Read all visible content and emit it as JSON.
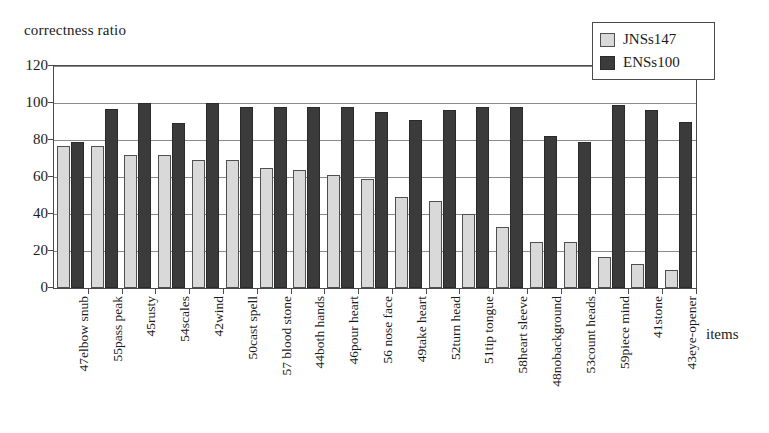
{
  "chart_data": {
    "type": "bar",
    "title": "",
    "ylabel": "correctness ratio",
    "xlabel": "items",
    "ylim": [
      0,
      120
    ],
    "yticks": [
      0,
      20,
      40,
      60,
      80,
      100,
      120
    ],
    "grid": true,
    "legend_position": "top-right",
    "categories": [
      "47elbow snub",
      "55pass peak",
      "45rusty",
      "54scales",
      "42wind",
      "50cast spell",
      "57 blood stone",
      "44both hands",
      "46pour heart",
      "56 nose face",
      "49take heart",
      "52turn head",
      "51tip tongue",
      "58heart sleeve",
      "48nobackground",
      "53count heads",
      "59piece mind",
      "41stone",
      "43eye-opener"
    ],
    "series": [
      {
        "name": "JNSs147",
        "color": "#d9d9d9",
        "values": [
          77,
          77,
          72,
          72,
          69,
          69,
          65,
          64,
          61,
          59,
          49,
          47,
          40,
          33,
          25,
          25,
          17,
          13,
          10
        ]
      },
      {
        "name": "ENSs100",
        "color": "#3b3b3b",
        "values": [
          79,
          97,
          100,
          89,
          100,
          98,
          98,
          98,
          98,
          95,
          91,
          96,
          98,
          98,
          82,
          79,
          99,
          96,
          90
        ]
      }
    ]
  },
  "legend": {
    "entries": [
      {
        "label": "JNSs147"
      },
      {
        "label": "ENSs100"
      }
    ]
  }
}
